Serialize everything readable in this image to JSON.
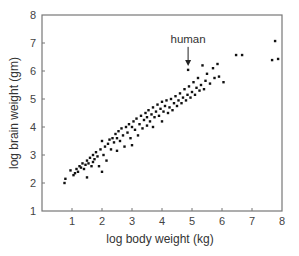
{
  "chart_data": {
    "type": "scatter",
    "title": "",
    "xlabel": "log body weight (kg)",
    "ylabel": "log brain weight (gm)",
    "xlim": [
      0,
      8
    ],
    "ylim": [
      1,
      8
    ],
    "xticks": [
      1,
      2,
      3,
      4,
      5,
      6,
      7,
      8
    ],
    "yticks": [
      1,
      2,
      3,
      4,
      5,
      6,
      7,
      8
    ],
    "grid": false,
    "legend": null,
    "annotations": [
      {
        "text": "human",
        "x": 4.87,
        "y": 6.04,
        "arrow": true
      }
    ],
    "series": [
      {
        "name": "species",
        "color": "#111111",
        "points": [
          [
            0.75,
            2.0
          ],
          [
            0.78,
            2.15
          ],
          [
            0.95,
            2.45
          ],
          [
            1.05,
            2.28
          ],
          [
            1.1,
            2.35
          ],
          [
            1.15,
            2.5
          ],
          [
            1.2,
            2.4
          ],
          [
            1.25,
            2.6
          ],
          [
            1.3,
            2.55
          ],
          [
            1.35,
            2.7
          ],
          [
            1.4,
            2.5
          ],
          [
            1.45,
            2.65
          ],
          [
            1.5,
            2.2
          ],
          [
            1.5,
            2.8
          ],
          [
            1.55,
            2.7
          ],
          [
            1.6,
            2.9
          ],
          [
            1.65,
            2.6
          ],
          [
            1.7,
            3.0
          ],
          [
            1.7,
            2.75
          ],
          [
            1.75,
            2.85
          ],
          [
            1.8,
            3.1
          ],
          [
            1.85,
            2.95
          ],
          [
            1.9,
            2.6
          ],
          [
            1.95,
            3.2
          ],
          [
            2.0,
            2.4
          ],
          [
            2.0,
            3.5
          ],
          [
            2.05,
            3.0
          ],
          [
            2.1,
            3.3
          ],
          [
            2.15,
            2.8
          ],
          [
            2.2,
            3.4
          ],
          [
            2.25,
            3.55
          ],
          [
            2.3,
            3.2
          ],
          [
            2.35,
            3.6
          ],
          [
            2.4,
            3.45
          ],
          [
            2.45,
            3.75
          ],
          [
            2.5,
            3.15
          ],
          [
            2.5,
            3.6
          ],
          [
            2.55,
            3.85
          ],
          [
            2.6,
            3.5
          ],
          [
            2.65,
            3.95
          ],
          [
            2.7,
            3.7
          ],
          [
            2.75,
            3.3
          ],
          [
            2.8,
            4.0
          ],
          [
            2.85,
            3.8
          ],
          [
            2.9,
            4.1
          ],
          [
            2.95,
            3.6
          ],
          [
            3.0,
            3.35
          ],
          [
            3.0,
            4.0
          ],
          [
            3.05,
            4.2
          ],
          [
            3.1,
            3.9
          ],
          [
            3.15,
            4.3
          ],
          [
            3.2,
            3.7
          ],
          [
            3.25,
            4.1
          ],
          [
            3.3,
            4.4
          ],
          [
            3.35,
            3.95
          ],
          [
            3.4,
            4.25
          ],
          [
            3.45,
            4.5
          ],
          [
            3.5,
            4.05
          ],
          [
            3.5,
            4.35
          ],
          [
            3.55,
            4.6
          ],
          [
            3.6,
            4.2
          ],
          [
            3.65,
            4.45
          ],
          [
            3.7,
            4.0
          ],
          [
            3.7,
            4.7
          ],
          [
            3.75,
            4.35
          ],
          [
            3.8,
            4.55
          ],
          [
            3.85,
            4.8
          ],
          [
            3.9,
            4.4
          ],
          [
            3.95,
            4.65
          ],
          [
            4.0,
            4.2
          ],
          [
            4.0,
            4.9
          ],
          [
            4.05,
            4.55
          ],
          [
            4.1,
            4.75
          ],
          [
            4.15,
            4.95
          ],
          [
            4.2,
            4.5
          ],
          [
            4.25,
            4.7
          ],
          [
            4.3,
            5.0
          ],
          [
            4.35,
            4.6
          ],
          [
            4.4,
            4.85
          ],
          [
            4.45,
            5.1
          ],
          [
            4.5,
            4.75
          ],
          [
            4.55,
            4.95
          ],
          [
            4.6,
            5.2
          ],
          [
            4.65,
            4.85
          ],
          [
            4.7,
            5.05
          ],
          [
            4.75,
            5.35
          ],
          [
            4.8,
            4.95
          ],
          [
            4.85,
            5.15
          ],
          [
            4.87,
            6.04
          ],
          [
            4.9,
            5.45
          ],
          [
            4.95,
            5.05
          ],
          [
            5.0,
            5.25
          ],
          [
            5.05,
            5.6
          ],
          [
            5.1,
            5.15
          ],
          [
            5.15,
            5.4
          ],
          [
            5.2,
            5.75
          ],
          [
            5.25,
            5.3
          ],
          [
            5.3,
            5.5
          ],
          [
            5.35,
            6.2
          ],
          [
            5.4,
            5.35
          ],
          [
            5.45,
            5.65
          ],
          [
            5.5,
            5.9
          ],
          [
            5.6,
            5.55
          ],
          [
            5.7,
            6.1
          ],
          [
            5.75,
            5.75
          ],
          [
            5.85,
            6.25
          ],
          [
            5.9,
            5.8
          ],
          [
            6.05,
            5.6
          ],
          [
            6.47,
            6.57
          ],
          [
            6.67,
            6.57
          ],
          [
            7.67,
            6.39
          ],
          [
            7.77,
            7.07
          ],
          [
            7.87,
            6.43
          ]
        ]
      }
    ]
  }
}
